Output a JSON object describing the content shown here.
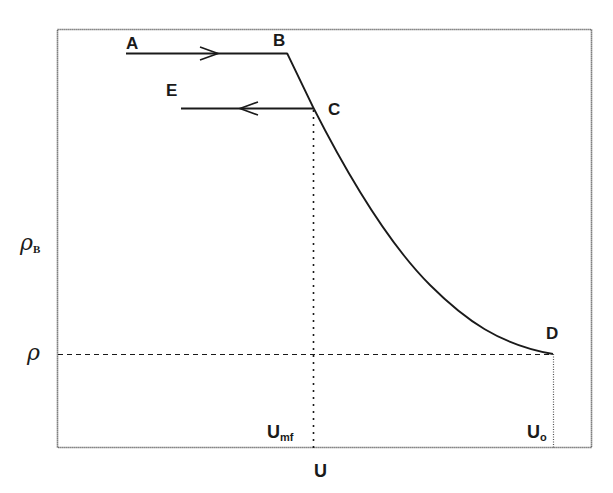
{
  "diagram": {
    "title": "",
    "colors": {
      "line": "#1a1a1a",
      "frame": "#555555",
      "background": "#ffffff"
    },
    "points": {
      "A": {
        "label": "A",
        "x": 126,
        "y": 53
      },
      "B": {
        "label": "B",
        "x": 287,
        "y": 53
      },
      "C": {
        "label": "C",
        "x": 313,
        "y": 107
      },
      "D": {
        "label": "D",
        "x": 553,
        "y": 354
      },
      "E": {
        "label": "E",
        "x": 181,
        "y": 108
      }
    },
    "y_axis": {
      "labels": [
        {
          "main": "ρ",
          "sub": "B",
          "role": "bed density"
        },
        {
          "main": "ρ",
          "sub": "",
          "role": "fluid density"
        }
      ]
    },
    "x_axis": {
      "title": "U",
      "ticks": [
        {
          "main": "U",
          "sub": "mf"
        },
        {
          "main": "U",
          "sub": "o"
        }
      ]
    },
    "arrows": [
      {
        "from": "A",
        "to": "B",
        "direction": "right"
      },
      {
        "from": "C",
        "to": "E",
        "direction": "left"
      }
    ],
    "guides": [
      {
        "type": "dotted-vertical",
        "from": "C",
        "to": "U_mf"
      },
      {
        "type": "dashed-horizontal",
        "from": "rho",
        "to": "D"
      },
      {
        "type": "dotted-vertical",
        "from": "D",
        "to": "U_o"
      }
    ]
  }
}
